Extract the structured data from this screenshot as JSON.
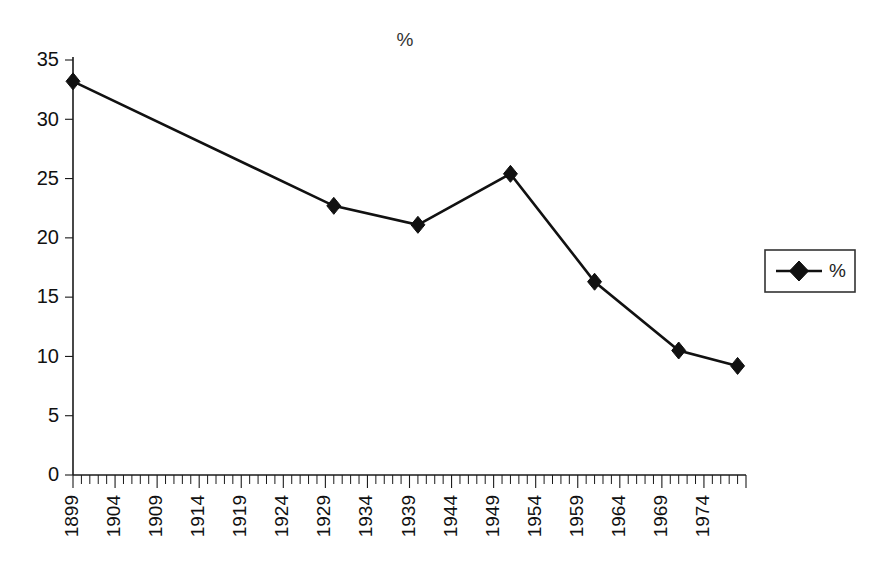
{
  "chart_data": {
    "type": "line",
    "title": "%",
    "xlabel": "",
    "ylabel": "",
    "grid": false,
    "legend_position": "right",
    "legend_entries": [
      "%"
    ],
    "xlim": [
      1899,
      1979
    ],
    "ylim": [
      0,
      35
    ],
    "y_ticks": [
      0,
      5,
      10,
      15,
      20,
      25,
      30,
      35
    ],
    "x_tick_labels": [
      "1899",
      "1904",
      "1909",
      "1914",
      "1919",
      "1924",
      "1929",
      "1934",
      "1939",
      "1944",
      "1949",
      "1954",
      "1959",
      "1964",
      "1969",
      "1974"
    ],
    "x_tick_label_step": 5,
    "x_minor_tick_step": 1,
    "series": [
      {
        "name": "%",
        "marker": "diamond",
        "color": "#111111",
        "x": [
          1899,
          1930,
          1940,
          1951,
          1961,
          1971,
          1978
        ],
        "values": [
          33.2,
          22.7,
          21.1,
          25.4,
          16.3,
          10.5,
          9.2
        ]
      }
    ]
  },
  "legend": {
    "label": "%"
  },
  "title": {
    "text": "%"
  },
  "colors": {
    "ink": "#111111",
    "background": "#ffffff"
  }
}
